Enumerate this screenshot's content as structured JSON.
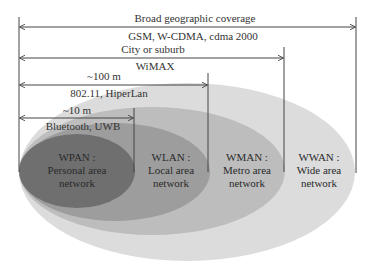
{
  "colors": {
    "wwan": "#dcdcdc",
    "wman": "#bcbcbc",
    "wlan": "#9c9c9c",
    "wpan": "#6e6e6e",
    "line": "#444444"
  },
  "ranges": [
    {
      "top_label": "Broad geographic coverage",
      "bottom_label": "GSM, W-CDMA, cdma 2000"
    },
    {
      "top_label": "City or suburb",
      "bottom_label": "WiMAX"
    },
    {
      "top_label": "~100 m",
      "bottom_label": "802.11, HiperLan"
    },
    {
      "top_label": "~10 m",
      "bottom_label": "Bluetooth, UWB"
    }
  ],
  "networks": [
    {
      "name": "WPAN :",
      "line1": "Personal area",
      "line2": "network"
    },
    {
      "name": "WLAN :",
      "line1": "Local area",
      "line2": "network"
    },
    {
      "name": "WMAN :",
      "line1": "Metro area",
      "line2": "network"
    },
    {
      "name": "WWAN :",
      "line1": "Wide area",
      "line2": "network"
    }
  ]
}
